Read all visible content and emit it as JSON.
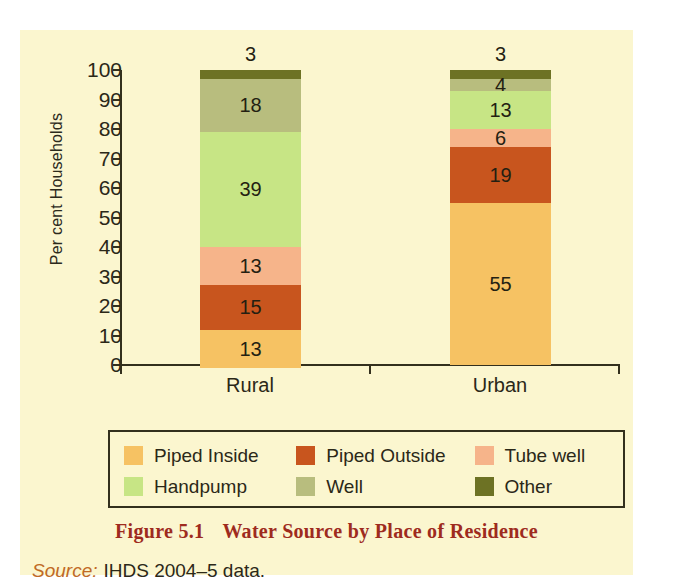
{
  "figure": {
    "caption_number": "Figure 5.1",
    "caption_title": "Water Source by Place of Residence",
    "source_label": "Source:",
    "source_text": "IHDS 2004–5 data.",
    "caption_color": "#9e2b1e",
    "source_label_color": "#c06a25",
    "background_color": "#fbf6cf"
  },
  "chart_data": {
    "type": "bar",
    "subtype": "stacked-vertical-100",
    "title": "Water Source by Place of Residence",
    "xlabel": "",
    "ylabel": "Per cent Households",
    "ylim": [
      0,
      100
    ],
    "ytick_step": 10,
    "yticks": [
      "100",
      "90",
      "80",
      "70",
      "60",
      "50",
      "40",
      "30",
      "20",
      "10",
      "0"
    ],
    "grid": false,
    "legend_position": "bottom",
    "categories": [
      "Rural",
      "Urban"
    ],
    "series": [
      {
        "name": "Piped Inside",
        "color": "#f6c263",
        "values": [
          13,
          55
        ]
      },
      {
        "name": "Piped Outside",
        "color": "#c8551e",
        "values": [
          15,
          19
        ]
      },
      {
        "name": "Tube well",
        "color": "#f6b48a",
        "values": [
          13,
          6
        ]
      },
      {
        "name": "Handpump",
        "color": "#c7e585",
        "values": [
          39,
          13
        ]
      },
      {
        "name": "Well",
        "color": "#b8bd7e",
        "values": [
          18,
          4
        ]
      },
      {
        "name": "Other",
        "color": "#6d7224",
        "values": [
          3,
          3
        ]
      }
    ]
  },
  "bars": {
    "rural": {
      "category": "Rural",
      "segments": [
        {
          "name": "Other",
          "value": 3,
          "label": "3",
          "color": "#6d7224",
          "label_outside": true
        },
        {
          "name": "Well",
          "value": 18,
          "label": "18",
          "color": "#b8bd7e",
          "label_outside": false
        },
        {
          "name": "Handpump",
          "value": 39,
          "label": "39",
          "color": "#c7e585",
          "label_outside": false
        },
        {
          "name": "Tube well",
          "value": 13,
          "label": "13",
          "color": "#f6b48a",
          "label_outside": false
        },
        {
          "name": "Piped Outside",
          "value": 15,
          "label": "15",
          "color": "#c8551e",
          "label_outside": false
        },
        {
          "name": "Piped Inside",
          "value": 13,
          "label": "13",
          "color": "#f6c263",
          "label_outside": false
        }
      ]
    },
    "urban": {
      "category": "Urban",
      "segments": [
        {
          "name": "Other",
          "value": 3,
          "label": "3",
          "color": "#6d7224",
          "label_outside": true
        },
        {
          "name": "Well",
          "value": 4,
          "label": "4",
          "color": "#b8bd7e",
          "label_outside": false
        },
        {
          "name": "Handpump",
          "value": 13,
          "label": "13",
          "color": "#c7e585",
          "label_outside": false
        },
        {
          "name": "Tube well",
          "value": 6,
          "label": "6",
          "color": "#f6b48a",
          "label_outside": false
        },
        {
          "name": "Piped Outside",
          "value": 19,
          "label": "19",
          "color": "#c8551e",
          "label_outside": false
        },
        {
          "name": "Piped Inside",
          "value": 55,
          "label": "55",
          "color": "#f6c263",
          "label_outside": false
        }
      ]
    }
  },
  "legend": {
    "rows": [
      [
        {
          "label": "Piped Inside",
          "color": "#f6c263"
        },
        {
          "label": "Piped Outside",
          "color": "#c8551e"
        },
        {
          "label": "Tube well",
          "color": "#f6b48a"
        }
      ],
      [
        {
          "label": "Handpump",
          "color": "#c7e585"
        },
        {
          "label": "Well",
          "color": "#b8bd7e"
        },
        {
          "label": "Other",
          "color": "#6d7224"
        }
      ]
    ]
  }
}
